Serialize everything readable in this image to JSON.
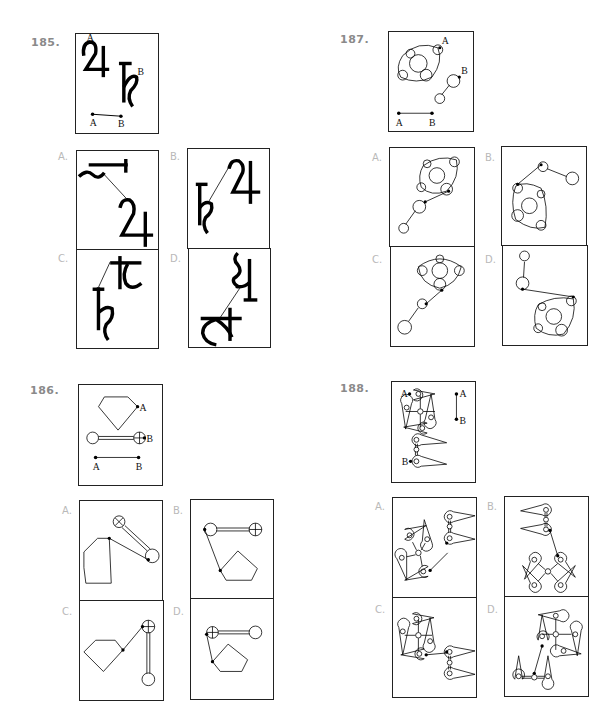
{
  "questions": [
    {
      "number": "185.",
      "key_labels": {
        "a": "A",
        "b": "B"
      },
      "description": "Two glyph shapes (Jupiter-like 4 symbol with point A, Saturn-like h symbol with point B) joined; segment AB reference",
      "options": [
        {
          "label": "A.",
          "description": "rotated h symbol connected to 4 symbol"
        },
        {
          "label": "B.",
          "description": "h symbol connected to 4 symbol"
        },
        {
          "label": "C.",
          "description": "h symbol connected to rotated 4 symbol"
        },
        {
          "label": "D.",
          "description": "rotated symbols connected by line"
        }
      ]
    },
    {
      "number": "186.",
      "key_labels": {
        "a": "A",
        "b": "B"
      },
      "description": "Pentagon with point A, dumbbell with crossed circle and point B; segment AB reference",
      "options": [
        {
          "label": "A.",
          "description": "pentagon connected to dumbbell (diagonal)"
        },
        {
          "label": "B.",
          "description": "dumbbell above pentagon, connected"
        },
        {
          "label": "C.",
          "description": "pentagon connected to vertical dumbbell"
        },
        {
          "label": "D.",
          "description": "crossed dumbbell above pentagon, connected"
        }
      ]
    },
    {
      "number": "187.",
      "key_labels": {
        "a": "A",
        "b": "B"
      },
      "description": "Circle cluster molecule with point A, two-circle chain with point B; segment AB reference",
      "options": [
        {
          "label": "A.",
          "description": "cluster upper-right, chain lower-left"
        },
        {
          "label": "B.",
          "description": "chain top, cluster lower-left"
        },
        {
          "label": "C.",
          "description": "diamond cluster with chain lower-left"
        },
        {
          "label": "D.",
          "description": "chain upper-left, cluster lower-right"
        }
      ]
    },
    {
      "number": "188.",
      "key_labels": {
        "a": "A",
        "b": "B"
      },
      "description": "Four-petal pinwheel with point A, two-petal link with point B; vertical segment AB reference",
      "options": [
        {
          "label": "A.",
          "description": "pinwheel lower-left connected to link upper-right"
        },
        {
          "label": "B.",
          "description": "link top, pinwheel bottom"
        },
        {
          "label": "C.",
          "description": "pinwheel left connected to link right"
        },
        {
          "label": "D.",
          "description": "pinwheel upper-right, link lower-left"
        }
      ]
    }
  ]
}
